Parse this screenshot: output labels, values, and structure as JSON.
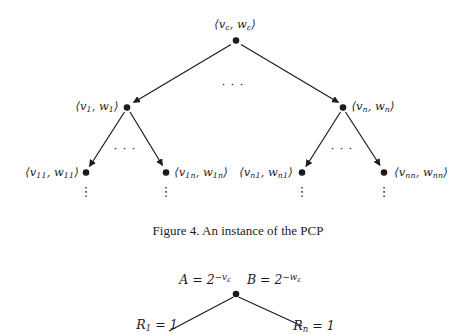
{
  "colors": {
    "ink": "#1c1c1c",
    "background": "#ffffff"
  },
  "figure4": {
    "caption": "Figure 4. An instance of the PCP",
    "ellipsis": "· · ·",
    "vdots": "⋮",
    "nodes": {
      "root": {
        "pre": "⟨v",
        "sub1": "ε",
        "mid": ", w",
        "sub2": "ε",
        "post": "⟩"
      },
      "child1": {
        "pre": "⟨v",
        "sub1": "1",
        "mid": ", w",
        "sub2": "1",
        "post": "⟩"
      },
      "childn": {
        "pre": "⟨v",
        "sub1": "n",
        "mid": ", w",
        "sub2": "n",
        "post": "⟩"
      },
      "leaf11": {
        "pre": "⟨v",
        "sub1": "11",
        "mid": ", w",
        "sub2": "11",
        "post": "⟩"
      },
      "leaf1n": {
        "pre": "⟨v",
        "sub1": "1n",
        "mid": ", w",
        "sub2": "1n",
        "post": "⟩"
      },
      "leafn1": {
        "pre": "⟨v",
        "sub1": "n1",
        "mid": ", w",
        "sub2": "n1",
        "post": "⟩"
      },
      "leafnn": {
        "pre": "⟨v",
        "sub1": "nn",
        "mid": ", w",
        "sub2": "nn",
        "post": "⟩"
      }
    }
  },
  "bottom_figure": {
    "label_a": {
      "base": "A = 2",
      "sup": "−v",
      "supsub": "ε"
    },
    "label_b": {
      "base": "B = 2",
      "sup": "−w",
      "supsub": "ε"
    },
    "label_r1": {
      "base": "R",
      "sub": "1",
      "rest": " = 1"
    },
    "label_rn": {
      "base": "R",
      "sub": "n",
      "rest": " = 1"
    }
  }
}
